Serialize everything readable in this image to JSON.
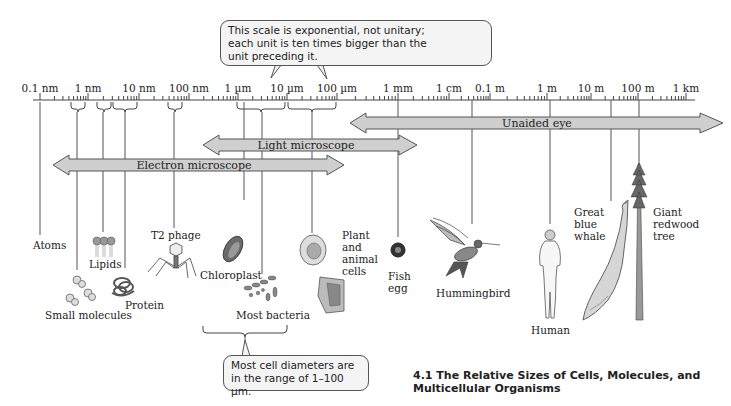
{
  "figure": {
    "caption_number": "4.1",
    "caption_line1": "4.1  The Relative Sizes of Cells, Molecules, and",
    "caption_line2": "Multicellular Organisms"
  },
  "callouts": {
    "scale_note_line1": "This scale is exponential, not unitary;",
    "scale_note_line2": "each unit is ten times bigger than the",
    "scale_note_line3": "unit preceding it.",
    "cell_range_line1": "Most cell diameters are",
    "cell_range_line2": "in the range of 1–100 µm."
  },
  "scale": {
    "ticks": [
      {
        "label": "0.1 nm",
        "x": 40
      },
      {
        "label": "1 nm",
        "x": 88
      },
      {
        "label": "10 nm",
        "x": 139
      },
      {
        "label": "100 nm",
        "x": 189
      },
      {
        "label": "1 µm",
        "x": 238
      },
      {
        "label": "10 µm",
        "x": 287
      },
      {
        "label": "100 µm",
        "x": 337
      },
      {
        "label": "1 mm",
        "x": 398
      },
      {
        "label": "1 cm",
        "x": 449
      },
      {
        "label": "0.1 m",
        "x": 490
      },
      {
        "label": "1 m",
        "x": 547
      },
      {
        "label": "10 m",
        "x": 591
      },
      {
        "label": "100 m",
        "x": 638
      },
      {
        "label": "1 km",
        "x": 686
      }
    ]
  },
  "ranges": {
    "unaided_eye": "Unaided eye",
    "light_microscope": "Light microscope",
    "electron_microscope": "Electron microscope"
  },
  "objects": {
    "atoms": "Atoms",
    "small_molecules": "Small molecules",
    "lipids": "Lipids",
    "protein": "Protein",
    "t2_phage": "T2 phage",
    "chloroplast": "Chloroplast",
    "most_bacteria": "Most bacteria",
    "plant_animal_cells_1": "Plant",
    "plant_animal_cells_2": "and",
    "plant_animal_cells_3": "animal",
    "plant_animal_cells_4": "cells",
    "fish_egg_1": "Fish",
    "fish_egg_2": "egg",
    "hummingbird": "Hummingbird",
    "human": "Human",
    "whale_1": "Great",
    "whale_2": "blue",
    "whale_3": "whale",
    "tree_1": "Giant",
    "tree_2": "redwood",
    "tree_3": "tree"
  },
  "colors": {
    "arrow_fill": "#cfcfcf",
    "arrow_stroke": "#555555",
    "callout_fill": "#f4f4f4",
    "line": "#444444"
  },
  "chart_data": {
    "type": "table",
    "title": "The Relative Sizes of Cells, Molecules, and Multicellular Organisms",
    "xlabel": "Size (log scale, each unit 10× the previous)",
    "axis_ticks": [
      "0.1 nm",
      "1 nm",
      "10 nm",
      "100 nm",
      "1 µm",
      "10 µm",
      "100 µm",
      "1 mm",
      "1 cm",
      "0.1 m",
      "1 m",
      "10 m",
      "100 m",
      "1 km"
    ],
    "ranges": [
      {
        "name": "Electron microscope",
        "from": "~0.1 nm",
        "to": "~100 µm"
      },
      {
        "name": "Light microscope",
        "from": "~1 µm",
        "to": "~1 mm"
      },
      {
        "name": "Unaided eye",
        "from": "~100 µm",
        "to": "~1 km"
      }
    ],
    "objects": [
      {
        "name": "Atoms",
        "size": "0.1 nm"
      },
      {
        "name": "Small molecules",
        "size": "~0.5–1 nm"
      },
      {
        "name": "Lipids",
        "size": "~2–5 nm"
      },
      {
        "name": "Protein",
        "size": "~5–10 nm"
      },
      {
        "name": "T2 phage",
        "size": "~50–100 nm"
      },
      {
        "name": "Chloroplast",
        "size": "~1–5 µm"
      },
      {
        "name": "Most bacteria",
        "size": "~1–10 µm"
      },
      {
        "name": "Plant and animal cells",
        "size": "~10–100 µm"
      },
      {
        "name": "Fish egg",
        "size": "~1 mm"
      },
      {
        "name": "Hummingbird",
        "size": "~5 cm"
      },
      {
        "name": "Human",
        "size": "~1.7 m"
      },
      {
        "name": "Great blue whale",
        "size": "~30 m"
      },
      {
        "name": "Giant redwood tree",
        "size": "~100 m"
      }
    ],
    "annotations": [
      "This scale is exponential, not unitary; each unit is ten times bigger than the unit preceding it.",
      "Most cell diameters are in the range of 1–100 µm."
    ]
  }
}
